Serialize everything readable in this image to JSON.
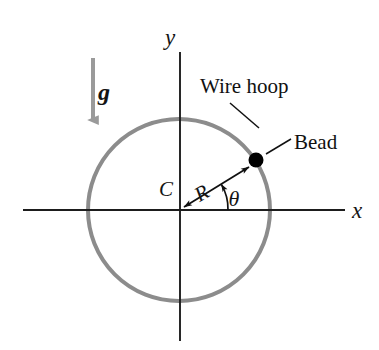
{
  "figure": {
    "width": 379,
    "height": 350,
    "background_color": "#ffffff"
  },
  "colors": {
    "hoop": "#8c8c8c",
    "gravity_arrow": "#9a9a9a",
    "axis": "#1d1d1d",
    "ink": "#111111",
    "bead": "#000000"
  },
  "axes": {
    "x_label": "x",
    "y_label": "y",
    "origin": {
      "x": 180,
      "y": 210
    },
    "x_axis": {
      "x1": 23,
      "y1": 210,
      "x2": 345,
      "y2": 210
    },
    "y_axis": {
      "x1": 180,
      "y1": 52,
      "x2": 180,
      "y2": 341
    },
    "x_label_pos": {
      "x": 355,
      "y": 217
    },
    "y_label_pos": {
      "x": 172,
      "y": 44
    }
  },
  "hoop": {
    "label": "Wire hoop",
    "center": {
      "x": 179,
      "y": 210
    },
    "radius": 91,
    "stroke_width": 4,
    "label_pos": {
      "x": 201,
      "y": 91
    },
    "leader": {
      "x1": 260,
      "y1": 127,
      "x2": 230,
      "y2": 104
    }
  },
  "bead": {
    "label": "Bead",
    "center": {
      "x": 256,
      "y": 160
    },
    "radius": 7.5,
    "label_pos": {
      "x": 296,
      "y": 148
    },
    "leader": {
      "x1": 268,
      "y1": 153,
      "x2": 290,
      "y2": 140
    }
  },
  "radius_vector": {
    "label": "R",
    "label_pos": {
      "x": 208,
      "y": 198
    },
    "from": {
      "x": 180,
      "y": 210
    },
    "to": {
      "x": 252,
      "y": 165
    },
    "double_headed": true
  },
  "angle": {
    "label": "θ",
    "label_pos": {
      "x": 231,
      "y": 207
    },
    "vertex": {
      "x": 180,
      "y": 210
    },
    "arc_radius": 48,
    "start_deg": 0,
    "end_deg": 32
  },
  "gravity": {
    "label": "g",
    "label_pos": {
      "x": 104,
      "y": 99
    },
    "arrow": {
      "x1": 93,
      "y1": 58,
      "x2": 93,
      "y2": 126
    },
    "stroke_width": 4,
    "direction": "down"
  }
}
